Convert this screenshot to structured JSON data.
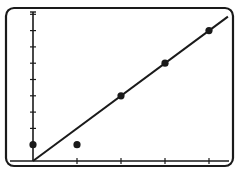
{
  "chart_data": {
    "type": "scatter",
    "title": "",
    "xlabel": "",
    "ylabel": "",
    "x": [
      0,
      1,
      2,
      3,
      4
    ],
    "series": [
      {
        "name": "data points",
        "values": [
          1,
          1,
          4,
          6,
          8
        ]
      }
    ],
    "fit_line": {
      "type": "linear",
      "slope": 2,
      "intercept": 0,
      "x_range": [
        0,
        4.5
      ]
    },
    "x_ticks": [
      1,
      2,
      3,
      4
    ],
    "y_ticks": [
      1,
      2,
      3,
      4,
      5,
      6,
      7,
      8,
      9
    ],
    "xlim": [
      0,
      4.5
    ],
    "ylim": [
      0,
      9
    ],
    "grid": false,
    "legend": "none",
    "tick_labels_visible": false
  },
  "colors": {
    "ink": "#1a1a1a",
    "background": "#ffffff"
  }
}
